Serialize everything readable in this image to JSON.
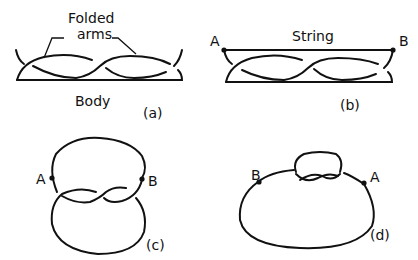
{
  "figure": {
    "panels": [
      {
        "id": "a",
        "caption": "(a)",
        "labels": {
          "top_line1": "Folded",
          "top_line2": "arms",
          "bottom": "Body"
        }
      },
      {
        "id": "b",
        "caption": "(b)",
        "labels": {
          "string": "String",
          "point_a": "A",
          "point_b": "B"
        }
      },
      {
        "id": "c",
        "caption": "(c)",
        "labels": {
          "point_a": "A",
          "point_b": "B"
        }
      },
      {
        "id": "d",
        "caption": "(d)",
        "labels": {
          "point_a": "A",
          "point_b": "B"
        }
      }
    ],
    "colors": {
      "ink": "#111111",
      "background": "#ffffff"
    }
  }
}
